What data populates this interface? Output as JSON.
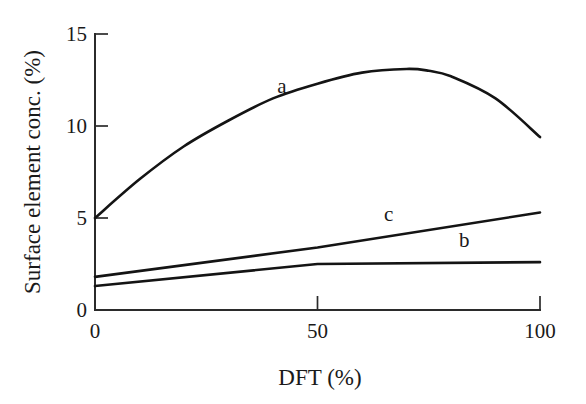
{
  "chart_data": {
    "type": "line",
    "title": "",
    "xlabel": "DFT (%)",
    "ylabel": "Surface element conc. (%)",
    "xlim": [
      0,
      100
    ],
    "ylim": [
      0,
      15
    ],
    "xticks": [
      "0",
      "50",
      "100"
    ],
    "xtick_values": [
      0,
      50,
      100
    ],
    "yticks": [
      "0",
      "5",
      "10",
      "15"
    ],
    "ytick_values": [
      0,
      5,
      10,
      15
    ],
    "grid": false,
    "legend": "inline-curve-labels",
    "series": [
      {
        "name": "a",
        "label": "a",
        "label_x": 42,
        "label_y": 11.8,
        "x": [
          0,
          10,
          20,
          30,
          40,
          50,
          60,
          70,
          75,
          80,
          90,
          100
        ],
        "values": [
          5.0,
          7.1,
          8.9,
          10.3,
          11.5,
          12.3,
          12.9,
          13.1,
          13.0,
          12.7,
          11.5,
          9.4
        ]
      },
      {
        "name": "b",
        "label": "b",
        "label_x": 83,
        "label_y": 3.45,
        "x": [
          0,
          50,
          100
        ],
        "values": [
          1.3,
          2.5,
          2.6
        ]
      },
      {
        "name": "c",
        "label": "c",
        "label_x": 66,
        "label_y": 4.85,
        "x": [
          0,
          50,
          100
        ],
        "values": [
          1.8,
          3.4,
          5.3
        ]
      }
    ],
    "colors": {
      "line": "#141414",
      "axis": "#2b2b2b",
      "background": "#ffffff"
    }
  },
  "axis_labels": {
    "x_title": "DFT (%)",
    "y_title": "Surface element conc. (%)"
  }
}
